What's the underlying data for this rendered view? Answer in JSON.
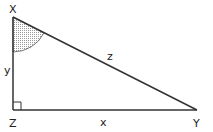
{
  "diagram": {
    "type": "right-triangle",
    "vertices": [
      {
        "label": "X",
        "x": 13,
        "y": 17
      },
      {
        "label": "Y",
        "x": 197,
        "y": 110
      },
      {
        "label": "Z",
        "x": 13,
        "y": 110
      }
    ],
    "sides": [
      {
        "label": "y",
        "from": "X",
        "to": "Z"
      },
      {
        "label": "x",
        "from": "Z",
        "to": "Y"
      },
      {
        "label": "z",
        "from": "X",
        "to": "Y"
      }
    ],
    "right_angle_at": "Z",
    "marked_angle_at": "X",
    "colors": {
      "stroke": "#333333",
      "shade": "#bbbbbb"
    }
  }
}
